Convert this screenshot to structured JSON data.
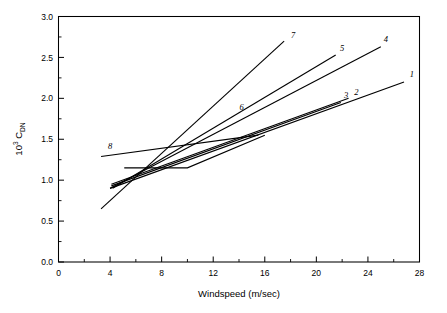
{
  "chart_data": {
    "type": "line",
    "title": "",
    "xlabel": "Windspeed (m/sec)",
    "ylabel": "10^3 C_DN",
    "ylabel_parts": {
      "mantissa": "10",
      "exponent": "3",
      "symbol": "C",
      "subscript": "DN"
    },
    "xlim": [
      0,
      28
    ],
    "ylim": [
      0.0,
      3.0
    ],
    "xticks": [
      0,
      4,
      8,
      12,
      16,
      20,
      24,
      28
    ],
    "xtick_labels": [
      "0",
      "4",
      "8",
      "12",
      "16",
      "20",
      "24",
      "28"
    ],
    "yticks": [
      0.0,
      0.5,
      1.0,
      1.5,
      2.0,
      2.5,
      3.0
    ],
    "ytick_labels": [
      "0.0",
      "0.5",
      "1.0",
      "1.5",
      "2.0",
      "2.5",
      "3.0"
    ],
    "xminor_step": 2,
    "yminor_step": 0.25,
    "grid": false,
    "legend": "inline-end-labels",
    "line_color": "#000000",
    "series": [
      {
        "name": "1",
        "label": "1",
        "label_x": 27.4,
        "label_y": 2.3,
        "points": [
          [
            4.0,
            0.9
          ],
          [
            26.8,
            2.2
          ]
        ]
      },
      {
        "name": "2",
        "label": "2",
        "label_x": 23.1,
        "label_y": 2.08,
        "points": [
          [
            4.1,
            0.95
          ],
          [
            22.5,
            2.0
          ]
        ]
      },
      {
        "name": "3",
        "label": "3",
        "label_x": 22.3,
        "label_y": 2.04,
        "points": [
          [
            4.1,
            0.93
          ],
          [
            21.9,
            1.95
          ]
        ]
      },
      {
        "name": "4",
        "label": "4",
        "label_x": 25.4,
        "label_y": 2.72,
        "points": [
          [
            4.0,
            0.9
          ],
          [
            25.0,
            2.63
          ]
        ]
      },
      {
        "name": "5",
        "label": "5",
        "label_x": 22.0,
        "label_y": 2.62,
        "points": [
          [
            4.2,
            0.9
          ],
          [
            21.5,
            2.53
          ]
        ]
      },
      {
        "name": "6",
        "label": "6",
        "label_x": 14.2,
        "label_y": 1.9,
        "points": [
          [
            5.1,
            1.15
          ],
          [
            10.0,
            1.15
          ],
          [
            16.0,
            1.55
          ]
        ]
      },
      {
        "name": "7",
        "label": "7",
        "label_x": 18.2,
        "label_y": 2.78,
        "points": [
          [
            3.3,
            0.65
          ],
          [
            17.5,
            2.7
          ]
        ]
      },
      {
        "name": "8",
        "label": "8",
        "label_x": 4.0,
        "label_y": 1.42,
        "points": [
          [
            3.3,
            1.29
          ],
          [
            15.5,
            1.55
          ]
        ]
      }
    ]
  },
  "figure": {
    "background": "#ffffff",
    "axis_color": "#000000"
  }
}
